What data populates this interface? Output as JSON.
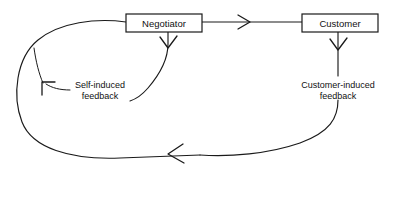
{
  "diagram": {
    "background_color": "#ffffff",
    "line_color": "#1a1a1a",
    "nodes": [
      {
        "id": "negotiator",
        "label": "Negotiator",
        "x": 126,
        "y": 14,
        "width": 76,
        "height": 18
      },
      {
        "id": "customer",
        "label": "Customer",
        "x": 302,
        "y": 14,
        "width": 76,
        "height": 18
      }
    ],
    "annotations": [
      {
        "id": "self-induced-feedback",
        "line1": "Self-induced",
        "line2": "feedback",
        "x": 100,
        "y": 87
      },
      {
        "id": "customer-induced-feedback",
        "line1": "Customer-induced",
        "line2": "feedback",
        "x": 338,
        "y": 87
      }
    ],
    "connections": [
      {
        "id": "negotiator-to-customer",
        "from": "negotiator",
        "to": "customer",
        "direction": "right",
        "arrowhead": "open-chevron"
      },
      {
        "id": "self-feedback-loop",
        "from": "negotiator",
        "to": "negotiator",
        "direction": "left-loop",
        "arrowhead": "open-chevron"
      },
      {
        "id": "customer-feedback-loop",
        "from": "customer",
        "to": "negotiator",
        "direction": "bottom-loop",
        "arrowhead": "open-chevron"
      },
      {
        "id": "negotiator-down-branch",
        "from": "negotiator",
        "to": "self-induced-feedback",
        "direction": "down",
        "arrowhead": "open-chevron"
      },
      {
        "id": "customer-down-branch",
        "from": "customer",
        "to": "customer-induced-feedback",
        "direction": "down",
        "arrowhead": "open-chevron"
      }
    ]
  }
}
